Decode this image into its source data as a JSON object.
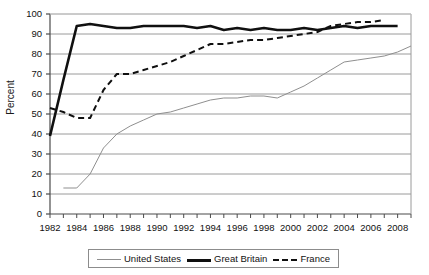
{
  "chart_data": {
    "type": "line",
    "title": "",
    "xlabel": "",
    "ylabel": "Percent",
    "xlim": [
      1982,
      2009
    ],
    "ylim": [
      0,
      100
    ],
    "ytick_step": 10,
    "yticks": [
      0,
      10,
      20,
      30,
      40,
      50,
      60,
      70,
      80,
      90,
      100
    ],
    "xticks": [
      1982,
      1984,
      1986,
      1988,
      1990,
      1992,
      1994,
      1996,
      1998,
      2000,
      2002,
      2004,
      2006,
      2008
    ],
    "minor_xticks": [
      1983,
      1985,
      1987,
      1989,
      1991,
      1993,
      1995,
      1997,
      1999,
      2001,
      2003,
      2005,
      2007,
      2009
    ],
    "grid": "horizontal",
    "legend_position": "bottom",
    "series": [
      {
        "name": "United States",
        "style": "thin-solid",
        "color": "#8f8f8f",
        "x": [
          1983,
          1984,
          1985,
          1986,
          1987,
          1988,
          1989,
          1990,
          1991,
          1992,
          1993,
          1994,
          1995,
          1996,
          1997,
          1998,
          1999,
          2000,
          2001,
          2002,
          2003,
          2004,
          2005,
          2006,
          2007,
          2008,
          2009
        ],
        "values": [
          13,
          13,
          20,
          33,
          40,
          44,
          47,
          50,
          51,
          53,
          55,
          57,
          58,
          58,
          59,
          59,
          58,
          61,
          64,
          68,
          72,
          76,
          77,
          78,
          79,
          81,
          84
        ]
      },
      {
        "name": "Great Britain",
        "style": "thick-solid",
        "color": "#101010",
        "x": [
          1982,
          1983,
          1984,
          1985,
          1986,
          1987,
          1988,
          1989,
          1990,
          1991,
          1992,
          1993,
          1994,
          1995,
          1996,
          1997,
          1998,
          1999,
          2000,
          2001,
          2002,
          2003,
          2004,
          2005,
          2006,
          2007,
          2008
        ],
        "values": [
          39,
          67,
          94,
          95,
          94,
          93,
          93,
          94,
          94,
          94,
          94,
          93,
          94,
          92,
          93,
          92,
          93,
          92,
          92,
          93,
          92,
          93,
          94,
          93,
          94,
          94,
          94
        ]
      },
      {
        "name": "France",
        "style": "dashed",
        "color": "#101010",
        "x": [
          1982,
          1983,
          1984,
          1985,
          1986,
          1987,
          1988,
          1989,
          1990,
          1991,
          1992,
          1993,
          1994,
          1995,
          1996,
          1997,
          1998,
          1999,
          2000,
          2001,
          2002,
          2003,
          2004,
          2005,
          2006,
          2007
        ],
        "values": [
          53,
          51,
          48,
          48,
          62,
          70,
          70,
          72,
          74,
          76,
          79,
          82,
          85,
          85,
          86,
          87,
          87,
          88,
          89,
          90,
          91,
          94,
          95,
          96,
          96,
          97
        ]
      }
    ]
  },
  "legend": {
    "items": [
      {
        "label": "United States"
      },
      {
        "label": "Great Britain"
      },
      {
        "label": "France"
      }
    ]
  }
}
